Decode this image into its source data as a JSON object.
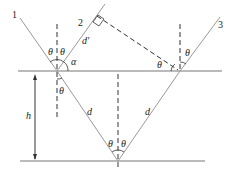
{
  "diagram": {
    "ray_labels": [
      "1",
      "2",
      "3"
    ],
    "theta": "θ",
    "alpha": "α",
    "d_prime": "d'",
    "d": "d",
    "h": "h"
  }
}
